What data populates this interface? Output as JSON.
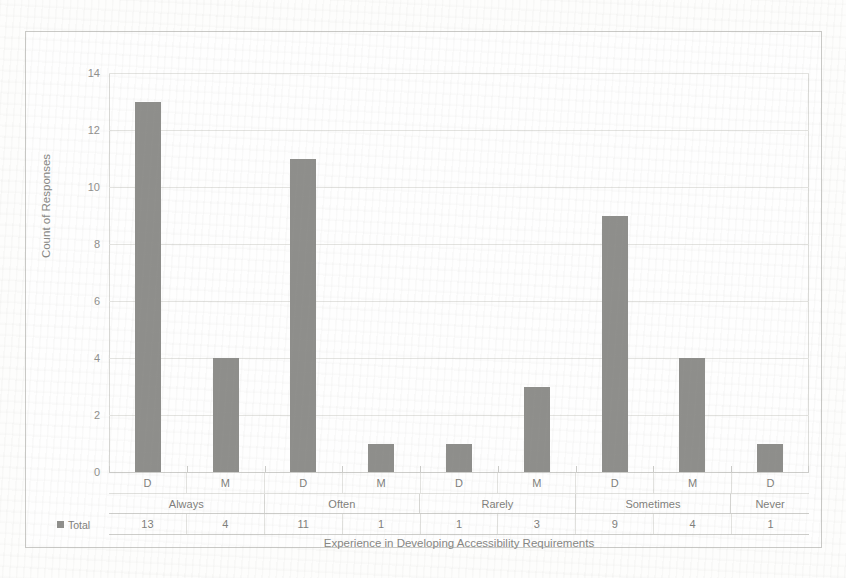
{
  "chart_data": {
    "type": "bar",
    "title": "",
    "xlabel": "Experience in Developing Accessibility Requirements",
    "ylabel": "Count of Responses",
    "ylim": [
      0,
      14
    ],
    "ytick_values": [
      0,
      2,
      4,
      6,
      8,
      10,
      12,
      14
    ],
    "ytick_labels": [
      "0",
      "2",
      "4",
      "6",
      "8",
      "10",
      "12",
      "14"
    ],
    "grid": true,
    "legend_position": "table-row-header",
    "series": [
      {
        "name": "Total",
        "values": [
          13,
          4,
          11,
          1,
          1,
          3,
          9,
          4,
          1
        ]
      }
    ],
    "categories": [
      "D",
      "M",
      "D",
      "M",
      "D",
      "M",
      "D",
      "M",
      "D"
    ],
    "groups": [
      {
        "label": "Always",
        "span": 2
      },
      {
        "label": "Often",
        "span": 2
      },
      {
        "label": "Rarely",
        "span": 2
      },
      {
        "label": "Sometimes",
        "span": 2
      },
      {
        "label": "Never",
        "span": 1
      }
    ],
    "bar_color": "#8e8e8b",
    "gridline_color": "#e3e3e0",
    "plot_background": "#fefefe",
    "frame_color": "#c9c9c6"
  },
  "table": {
    "legend_label": "Total",
    "row_subcategory": [
      "D",
      "M",
      "D",
      "M",
      "D",
      "M",
      "D",
      "M",
      "D"
    ],
    "row_group": [
      "Always",
      "Often",
      "Rarely",
      "Sometimes",
      "Never"
    ],
    "row_total": [
      "13",
      "4",
      "11",
      "1",
      "1",
      "3",
      "9",
      "4",
      "1"
    ]
  },
  "axis": {
    "y_title": "Count of Responses",
    "x_title": "Experience in Developing Accessibility Requirements",
    "y_labels": [
      "14",
      "12",
      "10",
      "8",
      "6",
      "4",
      "2",
      "0"
    ]
  }
}
